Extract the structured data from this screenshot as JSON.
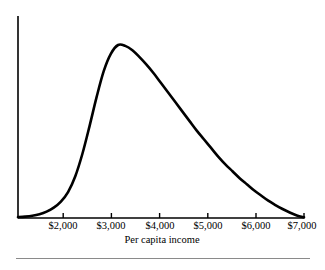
{
  "figure": {
    "background_color": "#ffffff",
    "ink_color": "#000000",
    "rule_color": "#8a8a8a"
  },
  "axes": {
    "y_axis": {
      "name": "vertical-axis",
      "x": 18,
      "y_top": 16,
      "y_bottom": 218
    },
    "x_axis": {
      "name": "horizontal-axis",
      "y": 218,
      "x_left": 18,
      "x_right": 304
    },
    "tick_length": 5
  },
  "chart_data": {
    "type": "line",
    "title": "",
    "subtitle": "",
    "xlabel": "Per capita income",
    "ylabel": "",
    "grid": false,
    "legend": null,
    "xlim": [
      1000,
      7000
    ],
    "ylim": [
      0,
      1.0
    ],
    "xticks": [
      2000,
      3000,
      4000,
      5000,
      6000,
      7000
    ],
    "xtick_labels": [
      "$2,000",
      "$3,000",
      "$4,000",
      "$5,000",
      "$6,000",
      "$7,000"
    ],
    "yticks": [],
    "ytick_labels": [],
    "annotations": [],
    "series": [
      {
        "name": "income-distribution",
        "color": "#000000",
        "line_width": 2.6,
        "x": [
          1000,
          1150,
          1300,
          1450,
          1600,
          1750,
          1900,
          2050,
          2200,
          2350,
          2500,
          2650,
          2800,
          2950,
          3100,
          3250,
          3400,
          3550,
          3700,
          3850,
          4000,
          4150,
          4300,
          4450,
          4600,
          4750,
          4900,
          5050,
          5200,
          5350,
          5500,
          5650,
          5800,
          5950,
          6100,
          6250,
          6400,
          6550,
          6700,
          6850,
          7000
        ],
        "y": [
          0.005,
          0.008,
          0.013,
          0.022,
          0.037,
          0.06,
          0.095,
          0.15,
          0.24,
          0.37,
          0.53,
          0.7,
          0.85,
          0.95,
          1.0,
          0.995,
          0.97,
          0.93,
          0.885,
          0.835,
          0.78,
          0.725,
          0.67,
          0.615,
          0.56,
          0.505,
          0.455,
          0.405,
          0.355,
          0.31,
          0.27,
          0.23,
          0.195,
          0.16,
          0.13,
          0.1,
          0.075,
          0.052,
          0.032,
          0.015,
          0.004
        ]
      }
    ]
  },
  "labels": {
    "x_axis_title": "Per capita income"
  }
}
